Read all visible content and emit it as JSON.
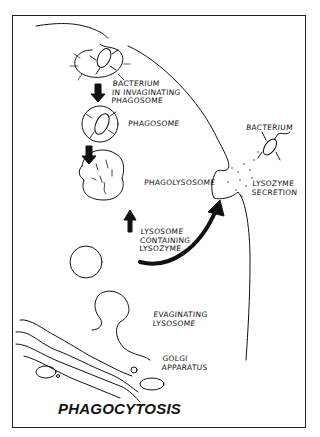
{
  "figure": {
    "title": "PHAGOCYTOSIS",
    "labels": {
      "bacterium_invaginating": "BACTERIUM\nIN INVAGINATING\nPHAGOSOME",
      "phagosome": "PHAGOSOME",
      "phagolysosome": "PHAGOLYSOSOME",
      "lysosome_containing": "LYSOSOME\nCONTAINING\nLYSOZYME",
      "evaginating_lysosome": "EVAGINATING\nLYSOSOME",
      "golgi": "GOLGI\nAPPARATUS",
      "bacterium_outside": "BACTERIUM",
      "lysozyme_secretion": "LYSOZYME\nSECRETION"
    },
    "colors": {
      "ink": "#111111",
      "background": "#ffffff"
    }
  }
}
